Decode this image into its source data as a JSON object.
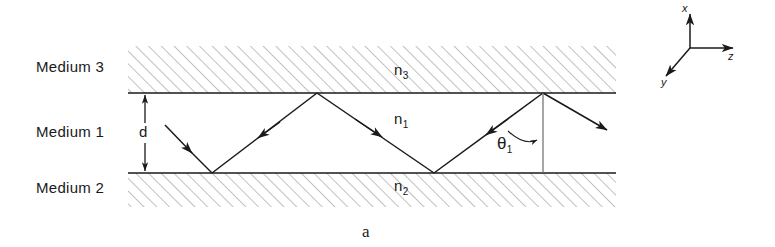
{
  "figure": {
    "caption": "a",
    "media": [
      {
        "name": "medium-3",
        "label": "Medium 3",
        "index_label": "n",
        "index_sub": "3"
      },
      {
        "name": "medium-1",
        "label": "Medium 1",
        "index_label": "n",
        "index_sub": "1"
      },
      {
        "name": "medium-2",
        "label": "Medium 2",
        "index_label": "n",
        "index_sub": "2"
      }
    ],
    "thickness_label": "d",
    "angle_label": "θ",
    "angle_sub": "1",
    "axes": [
      {
        "name": "x-axis",
        "label": "x"
      },
      {
        "name": "z-axis",
        "label": "z"
      },
      {
        "name": "y-axis",
        "label": "y"
      }
    ],
    "colors": {
      "stroke": "#1a1a1a",
      "hatch": "#8c8c8c",
      "interface": "#1a1a1a",
      "background": "#ffffff"
    }
  }
}
